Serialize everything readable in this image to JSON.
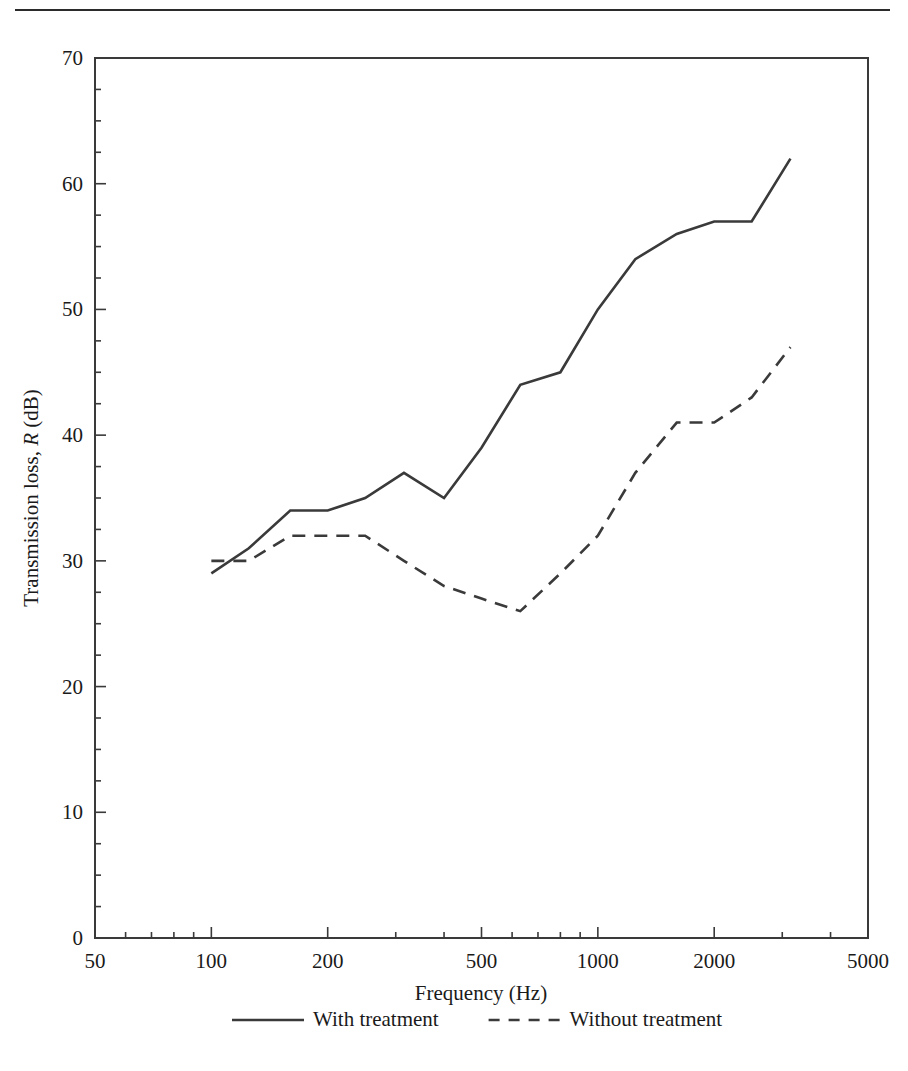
{
  "figure": {
    "top_rule": true
  },
  "chart_data": {
    "type": "line",
    "title": "",
    "xlabel": "Frequency (Hz)",
    "ylabel_prefix": "Transmission loss, ",
    "ylabel_italic": "R",
    "ylabel_suffix": " (dB)",
    "xscale": "log",
    "yscale": "linear",
    "xlim": [
      50,
      5000
    ],
    "ylim": [
      0,
      70
    ],
    "xticks": [
      50,
      100,
      200,
      500,
      1000,
      2000,
      5000
    ],
    "xtick_labels": [
      "50",
      "100",
      "200",
      "500",
      "1000",
      "2000",
      "5000"
    ],
    "yticks": [
      0,
      10,
      20,
      30,
      40,
      50,
      60,
      70
    ],
    "ytick_labels": [
      "0",
      "10",
      "20",
      "30",
      "40",
      "50",
      "60",
      "70"
    ],
    "yminor_step": 2.5,
    "grid": false,
    "legend_position": "below-axes",
    "series": [
      {
        "name": "With treatment",
        "style": "solid",
        "color": "#3a3a3a",
        "x": [
          100,
          125,
          160,
          200,
          250,
          315,
          400,
          500,
          630,
          800,
          1000,
          1250,
          1600,
          2000,
          2500,
          3150
        ],
        "y": [
          29,
          31,
          34,
          34,
          35,
          37,
          35,
          39,
          44,
          45,
          50,
          54,
          56,
          57,
          57,
          62
        ]
      },
      {
        "name": "Without treatment",
        "style": "dashed",
        "color": "#3a3a3a",
        "x": [
          100,
          125,
          160,
          200,
          250,
          315,
          400,
          500,
          630,
          800,
          1000,
          1250,
          1600,
          2000,
          2500,
          3150
        ],
        "y": [
          30,
          30,
          32,
          32,
          32,
          30,
          28,
          27,
          26,
          29,
          32,
          37,
          41,
          41,
          43,
          47
        ]
      }
    ]
  },
  "legend": {
    "items": [
      {
        "label": "With treatment",
        "style": "solid"
      },
      {
        "label": "Without treatment",
        "style": "dashed"
      }
    ]
  }
}
